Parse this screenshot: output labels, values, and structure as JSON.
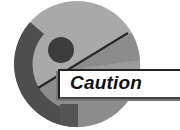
{
  "icon": {
    "name": "caution-icon",
    "label": "Caution",
    "colors": {
      "circle_light": "#a9a9a9",
      "circle_dark_band": "#4e4e4e",
      "circle_mid_wedge": "#858585",
      "dot": "#3c3c3c",
      "line": "#2a2a2a",
      "box_bg": "#ffffff",
      "text": "#111111"
    }
  }
}
